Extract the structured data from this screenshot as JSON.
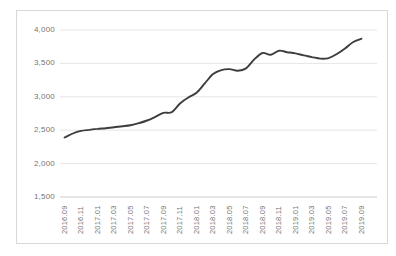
{
  "window": {
    "background": "#ffffff",
    "frame_border_color": "#d9d9d9"
  },
  "chart_data": {
    "type": "line",
    "title": "",
    "legend": "none",
    "grid": "horizontal",
    "ylim": [
      1500,
      4000
    ],
    "y_ticks": [
      4000,
      3500,
      3000,
      2500,
      2000,
      1500
    ],
    "y_tick_labels": [
      "4,000",
      "3,500",
      "3,000",
      "2,500",
      "2,000",
      "1,500"
    ],
    "x_tick_labels": [
      "2016.09",
      "2016.11",
      "2017.01",
      "2017.03",
      "2017.05",
      "2017.07",
      "2017.09",
      "2017.11",
      "2018.01",
      "2018.03",
      "2018.05",
      "2018.07",
      "2018.09",
      "2018.11",
      "2019.01",
      "2019.03",
      "2019.05",
      "2019.07",
      "2019.09"
    ],
    "x": [
      "2016.09",
      "2016.10",
      "2016.11",
      "2016.12",
      "2017.01",
      "2017.02",
      "2017.03",
      "2017.04",
      "2017.05",
      "2017.06",
      "2017.07",
      "2017.08",
      "2017.09",
      "2017.10",
      "2017.11",
      "2017.12",
      "2018.01",
      "2018.02",
      "2018.03",
      "2018.04",
      "2018.05",
      "2018.06",
      "2018.07",
      "2018.08",
      "2018.09",
      "2018.10",
      "2018.11",
      "2018.12",
      "2019.01",
      "2019.02",
      "2019.03",
      "2019.04",
      "2019.05",
      "2019.06",
      "2019.07",
      "2019.08",
      "2019.09"
    ],
    "series": [
      {
        "name": "value",
        "color": "#3d3d3d",
        "values": [
          2390,
          2450,
          2490,
          2505,
          2520,
          2530,
          2545,
          2560,
          2575,
          2605,
          2645,
          2700,
          2760,
          2770,
          2900,
          2990,
          3060,
          3200,
          3340,
          3400,
          3415,
          3390,
          3425,
          3560,
          3655,
          3630,
          3690,
          3668,
          3650,
          3620,
          3595,
          3572,
          3580,
          3640,
          3725,
          3820,
          3870
        ]
      }
    ],
    "styles": {
      "gridline_color": "#e6e6e6",
      "axis_line_color": "#cccccc",
      "tick_label_color": "#757575"
    }
  }
}
